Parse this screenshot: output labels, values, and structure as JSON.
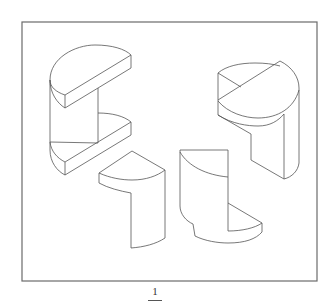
{
  "figure": {
    "label": "1",
    "pieces": [
      {
        "id": "A",
        "position": "upper-left",
        "shape": "cylinder with two half-disc flanges"
      },
      {
        "id": "B",
        "position": "upper-right",
        "shape": "cylinder with notched quarter cut"
      },
      {
        "id": "C",
        "position": "lower-middle-left",
        "shape": "quarter-cylinder L piece"
      },
      {
        "id": "D",
        "position": "lower-middle-right",
        "shape": "stepped quarter-cylinder piece"
      }
    ],
    "colors": {
      "line": "#555555",
      "frame": "#6b6b6b",
      "background": "#ffffff"
    }
  }
}
